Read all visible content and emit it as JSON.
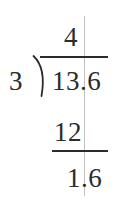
{
  "problem": {
    "type": "long-division",
    "expression": "13.6 / 3",
    "divisor": "3",
    "dividend": "13.6",
    "quotient": "4",
    "subtrahend": "12",
    "remainder": "1.6"
  },
  "marks": {
    "division_bracket_icon": "division-bracket-icon",
    "vinculum_label": "",
    "subtraction_rule_label": "",
    "decimal_guide_label": ""
  },
  "colors": {
    "ink": "#2b2b2b",
    "guide": "#c2c2c2",
    "background": "#ffffff"
  }
}
